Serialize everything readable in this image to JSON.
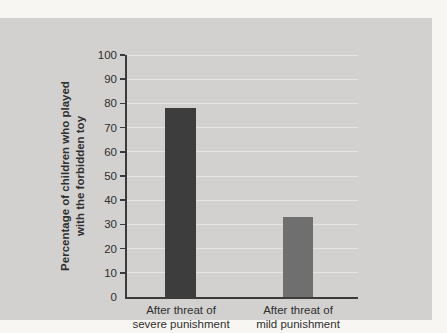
{
  "chart_data": {
    "type": "bar",
    "title": "",
    "ylabel_lines": [
      "Percentage of children who played",
      "with the forbidden toy"
    ],
    "xlabel": "",
    "categories": [
      [
        "After threat of",
        "severe punishment"
      ],
      [
        "After threat of",
        "mild punishment"
      ]
    ],
    "values": [
      78,
      33
    ],
    "ylim": [
      0,
      100
    ],
    "ytick_step": 10,
    "yticks": [
      "0",
      "10",
      "20",
      "30",
      "40",
      "50",
      "60",
      "70",
      "80",
      "90",
      "100"
    ],
    "grid": "horizontal",
    "legend_position": "none",
    "colors": {
      "bar_severe": "#3d3d3d",
      "bar_mild": "#6f6f6f",
      "panel_background": "#d2d1cf",
      "page_background": "#f8f6f2",
      "axis": "#3b3b3b",
      "text": "#2f2f2f",
      "gridline": "#e6e5e3"
    }
  }
}
